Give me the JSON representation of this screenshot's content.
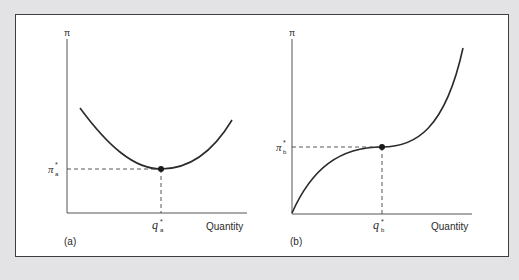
{
  "figure": {
    "panels": [
      {
        "id": "a",
        "panel_label": "(a)",
        "y_axis_label": "π",
        "x_axis_label": "Quantity",
        "curve_shape": "U-shaped (convex), minimum at marked point",
        "point": {
          "x_label_base": "q",
          "x_label_sub": "a",
          "y_label_base": "π",
          "y_label_sub": "a",
          "star": "*"
        }
      },
      {
        "id": "b",
        "panel_label": "(b)",
        "y_axis_label": "π",
        "x_axis_label": "Quantity",
        "curve_shape": "cubic-like, concave then inflection at marked point then convex rising",
        "point": {
          "x_label_base": "q",
          "x_label_sub": "b",
          "y_label_base": "π",
          "y_label_sub": "b",
          "star": "*"
        }
      }
    ],
    "colors": {
      "background": "#e3e3e5",
      "frame": "#ffffff",
      "border": "#3e3e44",
      "ink": "#2a2a2a"
    }
  }
}
